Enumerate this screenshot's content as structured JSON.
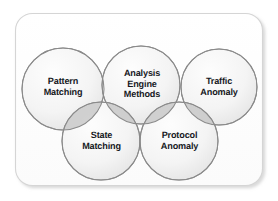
{
  "diagram": {
    "type": "venn-overlapping-circles",
    "title": "Analysis Engine Methods",
    "container": {
      "shape": "rounded-rectangle",
      "fill": "#fdfdfd",
      "border_color": "#d8d8d8",
      "shadow_color": "#e6e6e6"
    },
    "style": {
      "circle_fill_light": "#fcfcfc",
      "circle_fill_dark": "#eaeaea",
      "circle_stroke": "#8e8e8e",
      "overlap_fill": "#d0d0d0",
      "text_color": "#16181d"
    },
    "nodes": [
      {
        "id": "pattern-matching",
        "label": "Pattern\nMatching",
        "row": "top",
        "position": 1
      },
      {
        "id": "analysis-engine-methods",
        "label": "Analysis\nEngine\nMethods",
        "row": "top",
        "position": 2
      },
      {
        "id": "traffic-anomaly",
        "label": "Traffic\nAnomaly",
        "row": "top",
        "position": 3
      },
      {
        "id": "state-matching",
        "label": "State\nMatching",
        "row": "bottom",
        "position": 1
      },
      {
        "id": "protocol-anomaly",
        "label": "Protocol\nAnomaly",
        "row": "bottom",
        "position": 2
      }
    ]
  }
}
